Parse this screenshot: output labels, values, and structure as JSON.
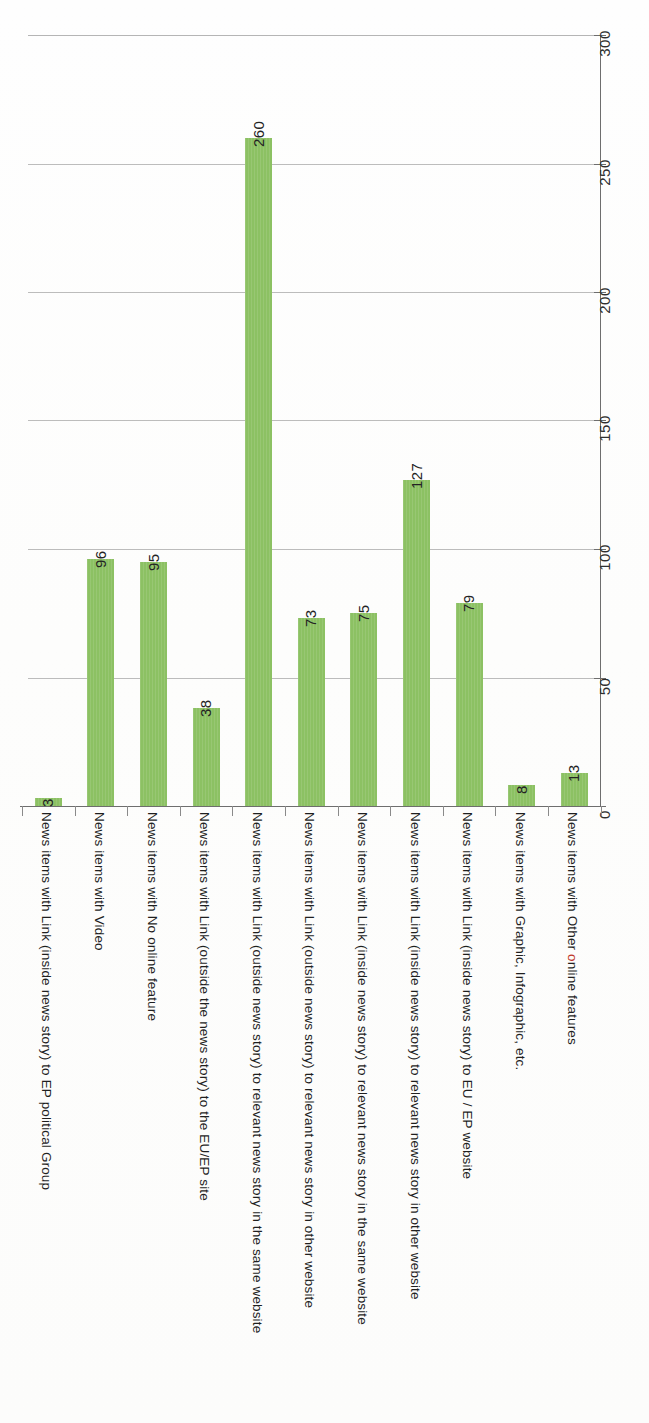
{
  "chart_data": {
    "type": "bar",
    "title": "",
    "subtitle": "",
    "xlabel": "",
    "ylabel": "",
    "orientation": "vertical-bars-rotated-page",
    "grid": true,
    "legend": "none",
    "ylim": [
      0,
      300
    ],
    "yticks": [
      0,
      50,
      100,
      150,
      200,
      250,
      300
    ],
    "ytick_labels": [
      "0",
      "50",
      "100",
      "150",
      "200",
      "250",
      "300"
    ],
    "categories": [
      "News items with Link (inside news story) to EP political Group",
      "News items with Video",
      "News items with No online feature",
      "News items with Link (outside the news story) to the EU/EP site",
      "News items with Link (outside news story) to relevant news story in the same website",
      "News items with Link (outside news story) to relevant news story in other website",
      "News items with Link (inside news story) to relevant news story in the same website",
      "News items with Link (inside news story) to relevant news story in other website",
      "News items with Link (inside news story) to EU / EP website",
      "News items with Graphic, Infographic, etc.",
      "News items with Other online features"
    ],
    "values": [
      3,
      96,
      95,
      38,
      260,
      73,
      75,
      127,
      79,
      8,
      13
    ],
    "value_labels": [
      "3",
      "96",
      "95",
      "38",
      "260",
      "73",
      "75",
      "127",
      "79",
      "8",
      "13"
    ],
    "series": [
      {
        "name": "News items",
        "values": [
          3,
          96,
          95,
          38,
          260,
          73,
          75,
          127,
          79,
          8,
          13
        ]
      }
    ],
    "colors": {
      "bar": "#8cc163",
      "gridline": "#9a9a9a",
      "axis": "#6e6e6e",
      "text": "#1f1f1f",
      "accent_red": "#c0392b",
      "background": "#fdfdfc"
    }
  }
}
